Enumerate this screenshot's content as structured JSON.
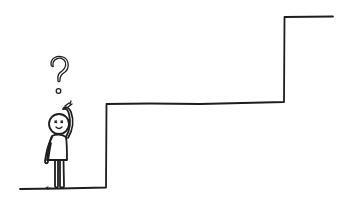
{
  "scene": {
    "description": "Hand-drawn stick figure scratching head with a question mark, standing in front of large stairs",
    "background_color": "#ffffff",
    "ink_color": "#1e1e1e"
  },
  "icons": {
    "question": "question-mark-icon",
    "figure": "confused-person-icon",
    "stairs": "stairs-icon"
  }
}
